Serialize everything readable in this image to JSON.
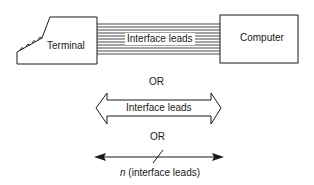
{
  "diagram": {
    "terminal_label": "Terminal",
    "computer_label": "Computer",
    "ribbon_label": "Interface leads",
    "or_1": "OR",
    "arrow_label": "Interface leads",
    "or_2": "OR",
    "line_label_italic": "n",
    "line_label_rest": " (interface leads)"
  },
  "colors": {
    "stroke": "#1a1a1a",
    "background": "#ffffff"
  }
}
